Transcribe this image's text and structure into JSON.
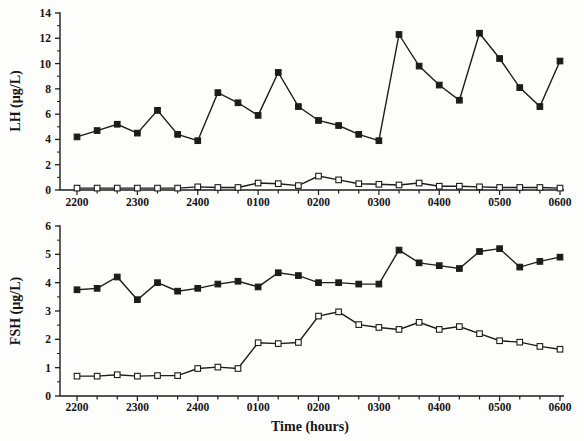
{
  "figure": {
    "background": "#fdfdfc",
    "line_color": "#1c1c1c",
    "marker_open_fill": "#ffffff"
  },
  "chart_data": [
    {
      "type": "line",
      "title": "",
      "ylabel": "LH (µg/L)",
      "xlabel": "",
      "ylim": [
        0,
        14
      ],
      "ytick_step": 2,
      "grid": false,
      "legend": "none",
      "x": [
        "2200",
        "2220",
        "2240",
        "2300",
        "2320",
        "2340",
        "2400",
        "0020",
        "0040",
        "0100",
        "0120",
        "0140",
        "0200",
        "0220",
        "0240",
        "0300",
        "0320",
        "0340",
        "0400",
        "0420",
        "0440",
        "0500",
        "0520",
        "0540",
        "0600"
      ],
      "x_tick_labels": [
        "2200",
        "2300",
        "2400",
        "0100",
        "0200",
        "0300",
        "0400",
        "0500",
        "0600"
      ],
      "series": [
        {
          "name": "lh-filled-square",
          "marker": "filled-square",
          "values": [
            4.2,
            4.7,
            5.2,
            4.5,
            6.3,
            4.4,
            3.9,
            7.7,
            6.9,
            5.9,
            9.3,
            6.6,
            5.5,
            5.1,
            4.4,
            3.9,
            12.3,
            9.8,
            8.3,
            7.1,
            12.4,
            10.4,
            8.1,
            6.6,
            10.2
          ]
        },
        {
          "name": "lh-open-square",
          "marker": "open-square",
          "values": [
            0.15,
            0.15,
            0.15,
            0.15,
            0.15,
            0.15,
            0.25,
            0.2,
            0.2,
            0.55,
            0.5,
            0.35,
            1.1,
            0.8,
            0.5,
            0.45,
            0.4,
            0.55,
            0.3,
            0.3,
            0.25,
            0.2,
            0.2,
            0.2,
            0.15
          ]
        }
      ]
    },
    {
      "type": "line",
      "title": "",
      "ylabel": "FSH (µg/L)",
      "xlabel": "Time (hours)",
      "ylim": [
        0,
        6
      ],
      "ytick_step": 1,
      "grid": false,
      "legend": "none",
      "x": [
        "2200",
        "2220",
        "2240",
        "2300",
        "2320",
        "2340",
        "2400",
        "0020",
        "0040",
        "0100",
        "0120",
        "0140",
        "0200",
        "0220",
        "0240",
        "0300",
        "0320",
        "0340",
        "0400",
        "0420",
        "0440",
        "0500",
        "0520",
        "0540",
        "0600"
      ],
      "x_tick_labels": [
        "2200",
        "2300",
        "2400",
        "0100",
        "0200",
        "0300",
        "0400",
        "0500",
        "0600"
      ],
      "series": [
        {
          "name": "fsh-filled-square",
          "marker": "filled-square",
          "values": [
            3.75,
            3.8,
            4.2,
            3.4,
            4.0,
            3.7,
            3.8,
            3.95,
            4.05,
            3.85,
            4.35,
            4.25,
            4.0,
            4.0,
            3.95,
            3.95,
            5.15,
            4.7,
            4.6,
            4.5,
            5.1,
            5.2,
            4.55,
            4.75,
            4.9
          ]
        },
        {
          "name": "fsh-open-square",
          "marker": "open-square",
          "values": [
            0.7,
            0.7,
            0.75,
            0.7,
            0.72,
            0.72,
            0.97,
            1.02,
            0.97,
            1.88,
            1.85,
            1.89,
            2.82,
            2.97,
            2.52,
            2.42,
            2.35,
            2.6,
            2.35,
            2.45,
            2.2,
            1.95,
            1.9,
            1.75,
            1.65
          ]
        }
      ]
    }
  ]
}
